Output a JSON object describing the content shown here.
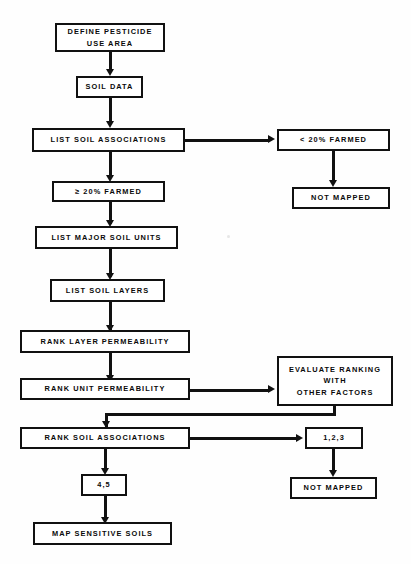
{
  "document": {
    "title": "Pesticide Use Area Soil Sensitivity Mapping Flowchart",
    "type": "flowchart",
    "background_color": "#fefefe",
    "line_color": "#111111",
    "text_color": "#0a0a0a"
  },
  "nodes": {
    "define_pesticide_use_area": {
      "line1": "DEFINE PESTICIDE",
      "line2": "USE AREA"
    },
    "soil_data": {
      "label": "SOIL DATA"
    },
    "list_soil_associations": {
      "label": "LIST SOIL ASSOCIATIONS"
    },
    "less_than_20_farmed": {
      "label": "< 20% FARMED"
    },
    "not_mapped_upper": {
      "label": "NOT MAPPED"
    },
    "gte_20_farmed": {
      "label": "≥ 20% FARMED"
    },
    "list_major_soil_units": {
      "label": "LIST MAJOR SOIL UNITS"
    },
    "list_soil_layers": {
      "label": "LIST SOIL LAYERS"
    },
    "rank_layer_permeability": {
      "label": "RANK LAYER PERMEABILITY"
    },
    "rank_unit_permeability": {
      "label": "RANK UNIT PERMEABILITY"
    },
    "evaluate_ranking": {
      "line1": "EVALUATE RANKING",
      "line2": "WITH",
      "line3": "OTHER FACTORS"
    },
    "rank_soil_associations": {
      "label": "RANK SOIL ASSOCIATIONS"
    },
    "classes_123": {
      "label": "1,2,3"
    },
    "not_mapped_lower": {
      "label": "NOT MAPPED"
    },
    "classes_45": {
      "label": "4,5"
    },
    "map_sensitive_soils": {
      "label": "MAP SENSITIVE SOILS"
    }
  },
  "edges": [
    {
      "from": "define_pesticide_use_area",
      "to": "soil_data"
    },
    {
      "from": "soil_data",
      "to": "list_soil_associations"
    },
    {
      "from": "list_soil_associations",
      "to": "less_than_20_farmed"
    },
    {
      "from": "list_soil_associations",
      "to": "gte_20_farmed"
    },
    {
      "from": "less_than_20_farmed",
      "to": "not_mapped_upper"
    },
    {
      "from": "gte_20_farmed",
      "to": "list_major_soil_units"
    },
    {
      "from": "list_major_soil_units",
      "to": "list_soil_layers"
    },
    {
      "from": "list_soil_layers",
      "to": "rank_layer_permeability"
    },
    {
      "from": "rank_layer_permeability",
      "to": "rank_unit_permeability"
    },
    {
      "from": "rank_unit_permeability",
      "to": "evaluate_ranking"
    },
    {
      "from": "evaluate_ranking",
      "to": "rank_soil_associations"
    },
    {
      "from": "rank_soil_associations",
      "to": "classes_123"
    },
    {
      "from": "rank_soil_associations",
      "to": "classes_45"
    },
    {
      "from": "classes_123",
      "to": "not_mapped_lower"
    },
    {
      "from": "classes_45",
      "to": "map_sensitive_soils"
    }
  ]
}
